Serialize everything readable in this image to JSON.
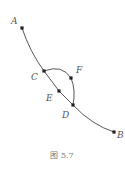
{
  "figure": {
    "caption": "图 5.7",
    "points": [
      {
        "id": "A",
        "label": "A",
        "x": 22,
        "y": 28,
        "lx": 11,
        "ly": 24
      },
      {
        "id": "C",
        "label": "C",
        "x": 44,
        "y": 71,
        "lx": 31,
        "ly": 80
      },
      {
        "id": "F",
        "label": "F",
        "x": 71,
        "y": 78,
        "lx": 76,
        "ly": 73
      },
      {
        "id": "E",
        "label": "E",
        "x": 59,
        "y": 91,
        "lx": 46,
        "ly": 101
      },
      {
        "id": "D",
        "label": "D",
        "x": 73,
        "y": 105,
        "lx": 62,
        "ly": 118
      },
      {
        "id": "B",
        "label": "B",
        "x": 114,
        "y": 132,
        "lx": 117,
        "ly": 138
      }
    ],
    "colors": {
      "stroke": "#444444",
      "point": "#222222",
      "label": "#555555"
    }
  }
}
